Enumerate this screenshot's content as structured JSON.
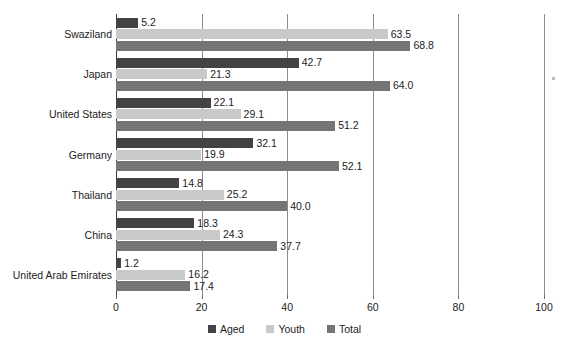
{
  "chart_data": {
    "type": "bar",
    "orientation": "horizontal",
    "title": "",
    "subtitle": "",
    "xlabel": "",
    "ylabel": "",
    "xlim": [
      0,
      100
    ],
    "xticks": [
      0,
      20,
      40,
      60,
      80,
      100
    ],
    "xtick_labels": [
      "0",
      "20",
      "40",
      "60",
      "80",
      "100"
    ],
    "grid": "vertical",
    "legend_position": "bottom-center",
    "categories": [
      "Swaziland",
      "Japan",
      "United States",
      "Germany",
      "Thailand",
      "China",
      "United Arab Emirates"
    ],
    "series": [
      {
        "name": "Aged",
        "color": "#434343",
        "values": [
          5.2,
          42.7,
          22.1,
          32.1,
          14.8,
          18.3,
          1.2
        ],
        "labels": [
          "5.2",
          "42.7",
          "22.1",
          "32.1",
          "14.8",
          "18.3",
          "1.2"
        ]
      },
      {
        "name": "Youth",
        "color": "#c9c9c9",
        "values": [
          63.5,
          21.3,
          29.1,
          19.9,
          25.2,
          24.3,
          16.2
        ],
        "labels": [
          "63.5",
          "21.3",
          "29.1",
          "19.9",
          "25.2",
          "24.3",
          "16.2"
        ]
      },
      {
        "name": "Total",
        "color": "#757575",
        "values": [
          68.8,
          64.0,
          51.2,
          52.1,
          40.0,
          37.7,
          17.4
        ],
        "labels": [
          "68.8",
          "64.0",
          "51.2",
          "52.1",
          "40.0",
          "37.7",
          "17.4"
        ]
      }
    ]
  },
  "legend": {
    "items": [
      {
        "label": "Aged",
        "color": "#434343"
      },
      {
        "label": "Youth",
        "color": "#c9c9c9"
      },
      {
        "label": "Total",
        "color": "#757575"
      }
    ]
  }
}
